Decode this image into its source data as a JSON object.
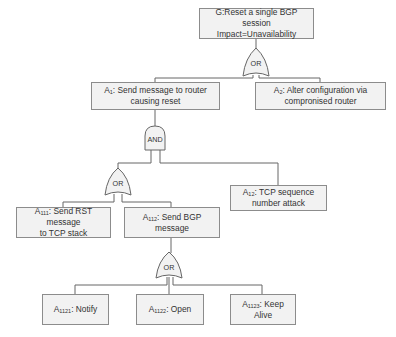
{
  "diagram": {
    "type": "attack-tree",
    "colors": {
      "node_fill": "#f2f2f2",
      "node_border": "#8c8c8c",
      "line": "#666666",
      "text": "#333333"
    },
    "root": {
      "id": "G",
      "label": "G:Reset a single BGP session\nImpact=Unavailability"
    },
    "gates": {
      "g_root": "OR",
      "g_a1": "AND",
      "g_a11": "OR",
      "g_a112": "OR"
    },
    "nodes": {
      "a1": {
        "prefix": "A",
        "sub": "1",
        "text": ": Send message to router\ncausing reset"
      },
      "a2": {
        "prefix": "A",
        "sub": "2",
        "text": ": Alter configuration via\ncompronised router"
      },
      "a12": {
        "prefix": "A",
        "sub": "12",
        "text": ": TCP sequence\nnumber attack"
      },
      "a111": {
        "prefix": "A",
        "sub": "111",
        "text": ": Send RST message\nto TCP stack"
      },
      "a112": {
        "prefix": "A",
        "sub": "112",
        "text": ": Send BGP\nmessage"
      },
      "a1121": {
        "prefix": "A",
        "sub": "1121",
        "text": ": Notify"
      },
      "a1122": {
        "prefix": "A",
        "sub": "1122",
        "text": ": Open"
      },
      "a1123": {
        "prefix": "A",
        "sub": "1123",
        "text": ": Keep Alive"
      }
    },
    "edges": [
      [
        "G",
        "OR(g_root)"
      ],
      [
        "OR(g_root)",
        "a1"
      ],
      [
        "OR(g_root)",
        "a2"
      ],
      [
        "a1",
        "AND(g_a1)"
      ],
      [
        "AND(g_a1)",
        "OR(g_a11)"
      ],
      [
        "AND(g_a1)",
        "a12"
      ],
      [
        "OR(g_a11)",
        "a111"
      ],
      [
        "OR(g_a11)",
        "a112"
      ],
      [
        "a112",
        "OR(g_a112)"
      ],
      [
        "OR(g_a112)",
        "a1121"
      ],
      [
        "OR(g_a112)",
        "a1122"
      ],
      [
        "OR(g_a112)",
        "a1123"
      ]
    ]
  }
}
